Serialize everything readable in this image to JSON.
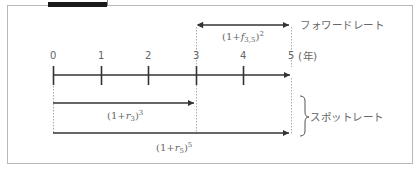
{
  "figure": {
    "caption": "",
    "frame_color": "#b8b8b8",
    "line_color": "#333333",
    "guide_color": "#aaaaaa"
  },
  "timeline": {
    "ticks": [
      "0",
      "1",
      "2",
      "3",
      "4",
      "5"
    ],
    "unit_label": "(年)"
  },
  "forward": {
    "formula_base": "(1+",
    "formula_var": "f",
    "formula_sub": "3,5",
    "formula_close": ")",
    "formula_exp": "2",
    "label": "フォワードレート"
  },
  "spot": {
    "r3": {
      "base": "(1+",
      "var": "r",
      "sub": "3",
      "close": ")",
      "exp": "3"
    },
    "r5": {
      "base": "(1+",
      "var": "r",
      "sub": "5",
      "close": ")",
      "exp": "5"
    },
    "label": "スポットレート"
  }
}
